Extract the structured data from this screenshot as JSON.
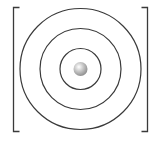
{
  "diagram": {
    "center": {
      "x": 80.5,
      "y": 69
    },
    "rings": [
      {
        "name": "inner-ring",
        "radius": 20.5
      },
      {
        "name": "middle-ring",
        "radius": 40.5
      },
      {
        "name": "outer-ring",
        "radius": 60.5
      }
    ],
    "nucleus": {
      "radius": 7,
      "highlight_color": "#ffffff",
      "mid_color": "#c8c8c8",
      "shadow_color": "#8a8a8a"
    },
    "brackets": {
      "left": {
        "x": 13.5,
        "top": 7.5,
        "bottom": 131.5,
        "arm": 6
      },
      "right": {
        "x": 147.5,
        "top": 7.5,
        "bottom": 131.5,
        "arm": 6
      }
    },
    "colors": {
      "line": "#3a3a3a",
      "background": "#ffffff"
    }
  }
}
